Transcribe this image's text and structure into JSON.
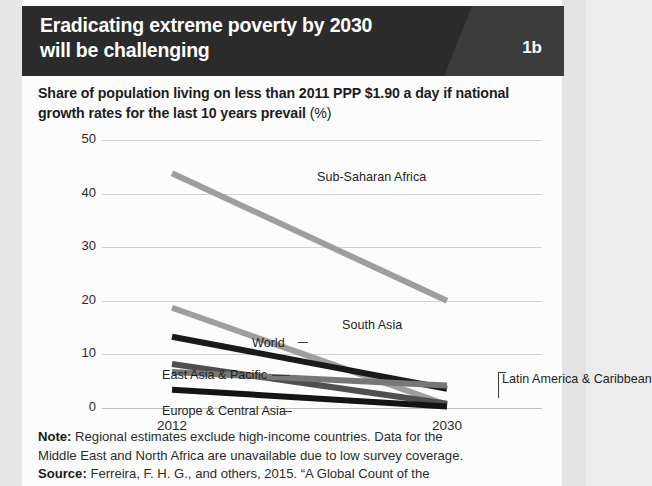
{
  "header": {
    "title_line1": "Eradicating extreme poverty by 2030",
    "title_line2": "will be challenging",
    "badge": "1b"
  },
  "subtitle": {
    "line1": "Share of population living on less than 2011 PPP $1.90 a day if",
    "line2": "national growth rates for the last 10 years prevail",
    "unit": "(%)"
  },
  "notes": {
    "note_label": "Note:",
    "note_line1": " Regional estimates exclude high-income countries. Data for the",
    "note_line2": "Middle East and North Africa are unavailable due to low survey coverage.",
    "source_label": "Source:",
    "source_line1": " Ferreira, F. H. G., and others, 2015. “A Global Count of the"
  },
  "chart_data": {
    "type": "line",
    "title": "Eradicating extreme poverty by 2030 will be challenging",
    "subtitle": "Share of population living on less than 2011 PPP $1.90 a day if national growth rates for the last 10 years prevail (%)",
    "xlabel": "",
    "ylabel": "",
    "x": [
      2012,
      2030
    ],
    "xtick_labels": [
      "2012",
      "2030"
    ],
    "ylim": [
      0,
      50
    ],
    "yticks": [
      0,
      10,
      20,
      30,
      40,
      50
    ],
    "ytick_labels": [
      "0",
      "10",
      "20",
      "30",
      "40",
      "50"
    ],
    "grid": true,
    "legend": "inline-labels",
    "series": [
      {
        "name": "Sub-Saharan Africa",
        "values": [
          43.8,
          20.0
        ],
        "color": "#9e9e9e",
        "label_x": 215,
        "label_y": 30,
        "label_anchor": "start"
      },
      {
        "name": "South Asia",
        "values": [
          18.7,
          0.6
        ],
        "color": "#9e9e9e",
        "label_x": 240,
        "label_y": 178,
        "label_anchor": "start"
      },
      {
        "name": "World",
        "values": [
          13.3,
          3.6
        ],
        "color": "#1a1a1a",
        "label_x": 150,
        "label_y": 196,
        "label_anchor": "start"
      },
      {
        "name": "East Asia & Pacific",
        "values": [
          8.2,
          0.8
        ],
        "color": "#4f4f4f",
        "label_x": 60,
        "label_y": 228,
        "label_anchor": "start"
      },
      {
        "name": "Latin America & Caribbean",
        "values": [
          6.7,
          4.2
        ],
        "color": "#777777",
        "label_x": 400,
        "label_y": 232,
        "label_anchor": "start"
      },
      {
        "name": "Europe & Central Asia",
        "values": [
          3.4,
          0.3
        ],
        "color": "#141414",
        "label_x": 60,
        "label_y": 264,
        "label_anchor": "start"
      }
    ]
  }
}
